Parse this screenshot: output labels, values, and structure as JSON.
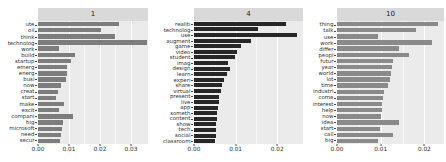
{
  "figure": {
    "type": "faceted-horizontal-bar-chart",
    "width": 446,
    "height": 162,
    "background": "#ffffff",
    "panel_background": "#ebebeb",
    "grid_color": "#ffffff",
    "strip_background": "#d9d9d9",
    "n_facets": 3
  },
  "chart_data": {
    "type": "bar",
    "orientation": "horizontal",
    "title": "",
    "xlabel": "",
    "ylabel": "",
    "grid": true,
    "legend": "none",
    "facet_labels": [
      "1",
      "4",
      "10"
    ],
    "facets": [
      {
        "label": "1",
        "bar_color": "#7d7d7d",
        "xlim": [
          0,
          0.0355
        ],
        "xticks": [
          0,
          0.01,
          0.02,
          0.03
        ],
        "xticklabels": [
          "0.00",
          "0.01",
          "0.02",
          "0.03"
        ],
        "categories": [
          "ute",
          "oil",
          "think",
          "technolog",
          "work",
          "build",
          "startup",
          "emerg",
          "energ",
          "busi",
          "now",
          "creat",
          "start",
          "make",
          "excit",
          "compani",
          "big",
          "microsoft",
          "need",
          "secur"
        ],
        "values": [
          0.0262,
          0.0203,
          0.0248,
          0.0352,
          0.0068,
          0.0118,
          0.0105,
          0.0095,
          0.0092,
          0.0089,
          0.0074,
          0.0066,
          0.0058,
          0.0085,
          0.0068,
          0.0112,
          0.0082,
          0.0079,
          0.0073,
          0.0071
        ]
      },
      {
        "label": "4",
        "bar_color": "#272727",
        "xlim": [
          0,
          0.0262
        ],
        "xticks": [
          0,
          0.01,
          0.02
        ],
        "xticklabels": [
          "0.00",
          "0.01",
          "0.02"
        ],
        "categories": [
          "realiti",
          "technolog",
          "use",
          "augment",
          "game",
          "video",
          "student",
          "imag",
          "design",
          "learn",
          "experi",
          "share",
          "virtual",
          "present",
          "live",
          "app",
          "someth",
          "content",
          "show",
          "tech",
          "social",
          "classroom"
        ],
        "values": [
          0.0222,
          0.0155,
          0.0248,
          0.0137,
          0.0112,
          0.0104,
          0.0098,
          0.0082,
          0.0086,
          0.0079,
          0.0073,
          0.0068,
          0.0064,
          0.0061,
          0.0059,
          0.0057,
          0.0056,
          0.0055,
          0.0054,
          0.0053,
          0.0052,
          0.0051
        ]
      },
      {
        "label": "10",
        "bar_color": "#8a8a8a",
        "xlim": [
          0,
          0.0245
        ],
        "xticks": [
          0,
          0.01,
          0.02
        ],
        "xticklabels": [
          "0.00",
          "0.01",
          "0.02"
        ],
        "categories": [
          "thing",
          "talk",
          "use",
          "work",
          "differ",
          "peopl",
          "futur",
          "year",
          "world",
          "lot",
          "time",
          "industri",
          "come",
          "interest",
          "help",
          "now",
          "idea",
          "start",
          "call",
          "big"
        ],
        "values": [
          0.0232,
          0.0181,
          0.0094,
          0.0218,
          0.0142,
          0.0166,
          0.0128,
          0.0126,
          0.0124,
          0.0122,
          0.0117,
          0.0108,
          0.0105,
          0.0104,
          0.0102,
          0.0101,
          0.0143,
          0.0098,
          0.0128,
          0.0093
        ]
      }
    ]
  }
}
